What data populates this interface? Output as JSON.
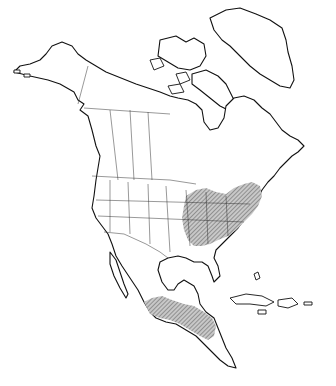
{
  "map": {
    "type": "species range map",
    "region": "North America",
    "style": "black outline on white, stippled/hatched range fill",
    "colors": {
      "background": "#ffffff",
      "outline": "#111111",
      "borders": "#333333",
      "range_fill": "#9a9a9a"
    },
    "shaded_regions": [
      "Eastern United States (Great Lakes south to Gulf states, east to Atlantic coast)",
      "Southern Ontario / St. Lawrence lowlands (partial)",
      "Southern and central Mexico",
      "Northern Central America (Guatemala, Belize, Honduras - partial)"
    ],
    "labels": []
  }
}
